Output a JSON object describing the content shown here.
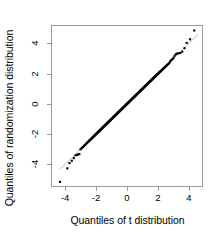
{
  "chart_data": {
    "type": "scatter",
    "title": "",
    "xlabel": "Quantiles of t distribution",
    "ylabel": "Quantiles of randomization distribution",
    "xlim": [
      -4.85,
      4.85
    ],
    "ylim": [
      -5.45,
      5.15
    ],
    "xticks": [
      -4,
      -2,
      0,
      2,
      4
    ],
    "yticks": [
      -4,
      -2,
      0,
      2,
      4
    ],
    "xticklabels": [
      "-4",
      "-2",
      "0",
      "2",
      "4"
    ],
    "yticklabels": [
      "-4",
      "-2",
      "0",
      "2",
      "4"
    ],
    "grid": false,
    "legend": null,
    "point_color": "#000000",
    "point_marker": "square",
    "point_size": 2.1,
    "reference_line": {
      "type": "identity",
      "slope": 1.0,
      "intercept": 0.0,
      "color": "#aaaaaa",
      "width": 0.8,
      "x_from": -4.35,
      "x_to": 4.6
    },
    "frame_color": "#9a9a9a",
    "background": "#ffffff",
    "series": [
      {
        "name": "quantile pairs",
        "x": [
          -4.33,
          -3.86,
          -3.72,
          -3.57,
          -3.44,
          -3.33,
          -3.24,
          -3.16,
          -3.08,
          -3.01,
          -2.95,
          -2.89,
          -2.83,
          -2.78,
          -2.73,
          -2.68,
          -2.63,
          -2.59,
          -2.55,
          -2.51,
          -2.47,
          -2.43,
          -2.4,
          -2.36,
          -2.33,
          -2.3,
          -2.27,
          -2.24,
          -2.21,
          -2.18,
          -2.15,
          -2.12,
          -2.1,
          -2.07,
          -2.05,
          -2.02,
          -2.0,
          -1.97,
          -1.95,
          -1.93,
          -1.9,
          -1.88,
          -1.86,
          -1.84,
          -1.82,
          -1.8,
          -1.78,
          -1.76,
          -1.74,
          -1.72,
          -1.7,
          -1.68,
          -1.66,
          -1.64,
          -1.62,
          -1.6,
          -1.58,
          -1.56,
          -1.54,
          -1.52,
          -1.5,
          -1.48,
          -1.46,
          -1.44,
          -1.42,
          -1.4,
          -1.38,
          -1.36,
          -1.34,
          -1.32,
          -1.3,
          -1.28,
          -1.26,
          -1.24,
          -1.22,
          -1.2,
          -1.18,
          -1.16,
          -1.14,
          -1.12,
          -1.1,
          -1.08,
          -1.06,
          -1.04,
          -1.02,
          -1.0,
          -0.98,
          -0.96,
          -0.94,
          -0.92,
          -0.9,
          -0.88,
          -0.86,
          -0.84,
          -0.82,
          -0.8,
          -0.78,
          -0.76,
          -0.74,
          -0.72,
          -0.7,
          -0.68,
          -0.66,
          -0.64,
          -0.62,
          -0.6,
          -0.58,
          -0.56,
          -0.54,
          -0.52,
          -0.5,
          -0.48,
          -0.46,
          -0.44,
          -0.42,
          -0.4,
          -0.38,
          -0.36,
          -0.34,
          -0.32,
          -0.3,
          -0.28,
          -0.26,
          -0.24,
          -0.22,
          -0.2,
          -0.18,
          -0.16,
          -0.14,
          -0.12,
          -0.1,
          -0.08,
          -0.06,
          -0.04,
          -0.02,
          0.0,
          0.02,
          0.04,
          0.06,
          0.08,
          0.1,
          0.12,
          0.14,
          0.16,
          0.18,
          0.2,
          0.22,
          0.24,
          0.26,
          0.28,
          0.3,
          0.32,
          0.34,
          0.36,
          0.38,
          0.4,
          0.42,
          0.44,
          0.46,
          0.48,
          0.5,
          0.52,
          0.54,
          0.56,
          0.58,
          0.6,
          0.62,
          0.64,
          0.66,
          0.68,
          0.7,
          0.72,
          0.74,
          0.76,
          0.78,
          0.8,
          0.82,
          0.84,
          0.86,
          0.88,
          0.9,
          0.92,
          0.94,
          0.96,
          0.98,
          1.0,
          1.02,
          1.04,
          1.06,
          1.08,
          1.1,
          1.12,
          1.14,
          1.16,
          1.18,
          1.2,
          1.22,
          1.24,
          1.26,
          1.28,
          1.3,
          1.32,
          1.34,
          1.36,
          1.38,
          1.4,
          1.42,
          1.44,
          1.46,
          1.48,
          1.5,
          1.52,
          1.54,
          1.56,
          1.58,
          1.6,
          1.62,
          1.64,
          1.66,
          1.68,
          1.7,
          1.72,
          1.74,
          1.76,
          1.78,
          1.8,
          1.82,
          1.84,
          1.86,
          1.88,
          1.9,
          1.93,
          1.95,
          1.97,
          2.0,
          2.02,
          2.05,
          2.07,
          2.1,
          2.12,
          2.15,
          2.18,
          2.21,
          2.24,
          2.27,
          2.3,
          2.33,
          2.36,
          2.4,
          2.43,
          2.47,
          2.51,
          2.55,
          2.59,
          2.63,
          2.68,
          2.73,
          2.78,
          2.83,
          2.89,
          2.95,
          3.01,
          3.08,
          3.16,
          3.24,
          3.33,
          3.44,
          3.57,
          3.72,
          3.86,
          4.08,
          4.35
        ],
        "y": [
          -5.18,
          -4.28,
          -3.93,
          -3.78,
          -3.6,
          -3.42,
          -3.39,
          -3.36,
          -3.33,
          -3.02,
          -2.97,
          -2.9,
          -2.86,
          -2.8,
          -2.74,
          -2.7,
          -2.64,
          -2.6,
          -2.56,
          -2.52,
          -2.48,
          -2.44,
          -2.41,
          -2.37,
          -2.34,
          -2.31,
          -2.28,
          -2.25,
          -2.22,
          -2.19,
          -2.16,
          -2.13,
          -2.11,
          -2.08,
          -2.06,
          -2.03,
          -2.01,
          -1.98,
          -1.96,
          -1.94,
          -1.91,
          -1.89,
          -1.87,
          -1.85,
          -1.83,
          -1.81,
          -1.79,
          -1.77,
          -1.75,
          -1.73,
          -1.71,
          -1.69,
          -1.67,
          -1.65,
          -1.63,
          -1.61,
          -1.59,
          -1.57,
          -1.55,
          -1.53,
          -1.51,
          -1.49,
          -1.47,
          -1.45,
          -1.43,
          -1.41,
          -1.39,
          -1.37,
          -1.35,
          -1.33,
          -1.31,
          -1.29,
          -1.27,
          -1.25,
          -1.23,
          -1.21,
          -1.19,
          -1.17,
          -1.15,
          -1.13,
          -1.11,
          -1.09,
          -1.07,
          -1.05,
          -1.03,
          -1.01,
          -0.99,
          -0.97,
          -0.95,
          -0.93,
          -0.91,
          -0.89,
          -0.87,
          -0.85,
          -0.83,
          -0.81,
          -0.79,
          -0.77,
          -0.75,
          -0.73,
          -0.71,
          -0.69,
          -0.67,
          -0.65,
          -0.63,
          -0.61,
          -0.59,
          -0.57,
          -0.55,
          -0.53,
          -0.51,
          -0.49,
          -0.47,
          -0.45,
          -0.43,
          -0.41,
          -0.39,
          -0.37,
          -0.35,
          -0.33,
          -0.31,
          -0.29,
          -0.27,
          -0.25,
          -0.23,
          -0.21,
          -0.19,
          -0.17,
          -0.15,
          -0.13,
          -0.11,
          -0.09,
          -0.07,
          -0.05,
          -0.03,
          -0.01,
          0.01,
          0.03,
          0.05,
          0.07,
          0.09,
          0.11,
          0.13,
          0.15,
          0.17,
          0.19,
          0.21,
          0.23,
          0.25,
          0.27,
          0.29,
          0.31,
          0.33,
          0.35,
          0.37,
          0.39,
          0.41,
          0.43,
          0.45,
          0.47,
          0.49,
          0.51,
          0.53,
          0.55,
          0.57,
          0.59,
          0.61,
          0.63,
          0.65,
          0.67,
          0.69,
          0.71,
          0.73,
          0.75,
          0.77,
          0.79,
          0.81,
          0.83,
          0.85,
          0.87,
          0.89,
          0.91,
          0.93,
          0.95,
          0.97,
          0.99,
          1.01,
          1.03,
          1.05,
          1.07,
          1.09,
          1.11,
          1.13,
          1.15,
          1.17,
          1.19,
          1.21,
          1.23,
          1.25,
          1.27,
          1.29,
          1.31,
          1.33,
          1.35,
          1.37,
          1.39,
          1.41,
          1.43,
          1.45,
          1.47,
          1.49,
          1.51,
          1.53,
          1.55,
          1.57,
          1.59,
          1.61,
          1.63,
          1.65,
          1.67,
          1.69,
          1.71,
          1.73,
          1.75,
          1.77,
          1.79,
          1.81,
          1.83,
          1.85,
          1.87,
          1.89,
          1.91,
          1.94,
          1.96,
          1.98,
          2.01,
          2.03,
          2.06,
          2.08,
          2.11,
          2.13,
          2.16,
          2.19,
          2.22,
          2.25,
          2.28,
          2.31,
          2.34,
          2.37,
          2.41,
          2.44,
          2.48,
          2.52,
          2.56,
          2.6,
          2.64,
          2.7,
          2.78,
          2.86,
          2.9,
          2.97,
          3.05,
          3.18,
          3.28,
          3.32,
          3.34,
          3.36,
          3.45,
          3.68,
          4.03,
          4.27,
          4.85
        ]
      }
    ]
  }
}
